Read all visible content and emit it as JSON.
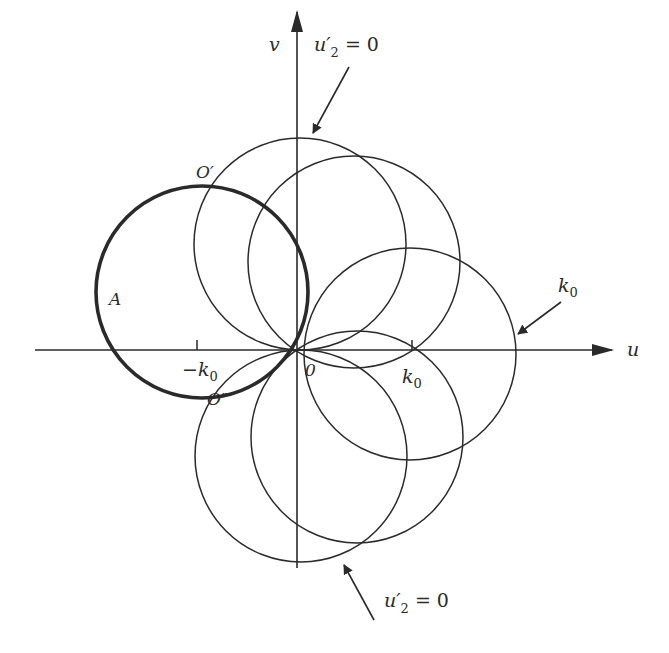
{
  "figure": {
    "type": "diagram",
    "colors": {
      "ink": "#2a2a2a",
      "background": "#ffffff"
    },
    "axes": {
      "u_label": "u",
      "v_label": "v",
      "origin_label": "0",
      "tick_neg_label": "−k",
      "tick_neg_sub": "0",
      "tick_pos_label": "k",
      "tick_pos_sub": "0"
    },
    "labels": {
      "A": "A",
      "O_prime": "O′",
      "O_double_prime": "O″",
      "k0_annot": "k",
      "k0_annot_sub": "0",
      "top_constraint": {
        "var": "u′",
        "sub": "2",
        "eq": " = 0"
      },
      "bottom_constraint": {
        "var": "u′",
        "sub": "2",
        "eq": " = 0"
      }
    },
    "circles": [
      {
        "name": "circle-A-bold",
        "cx": 202,
        "cy": 292,
        "r": 106,
        "bold": true
      },
      {
        "name": "circle-top",
        "cx": 300,
        "cy": 244,
        "r": 106,
        "bold": false
      },
      {
        "name": "circle-upper-right",
        "cx": 354,
        "cy": 262,
        "r": 106,
        "bold": false
      },
      {
        "name": "circle-right",
        "cx": 410,
        "cy": 354,
        "r": 106,
        "bold": false
      },
      {
        "name": "circle-lower-right",
        "cx": 357,
        "cy": 437,
        "r": 106,
        "bold": false
      },
      {
        "name": "circle-bottom",
        "cx": 301,
        "cy": 456,
        "r": 106,
        "bold": false
      }
    ]
  }
}
